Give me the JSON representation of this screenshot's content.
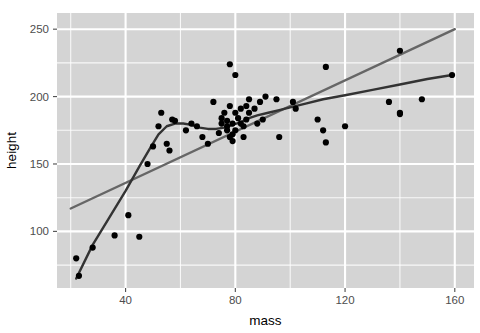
{
  "chart_data": {
    "type": "scatter",
    "title": "",
    "xlabel": "mass",
    "ylabel": "height",
    "xlim": [
      15,
      167
    ],
    "ylim": [
      58,
      262
    ],
    "xticks": [
      40,
      80,
      120,
      160
    ],
    "yticks": [
      100,
      150,
      200,
      250
    ],
    "xtick_labels": [
      "40",
      "80",
      "120",
      "160"
    ],
    "ytick_labels": [
      "100",
      "150",
      "200",
      "250"
    ],
    "grid": true,
    "legend": "none",
    "panel_background": "#d4d4d4",
    "grid_color_major": "#ffffff",
    "grid_color_minor": "#ffffff",
    "point_color": "#000000",
    "point_size": 3.1,
    "points": [
      {
        "x": 22,
        "y": 80
      },
      {
        "x": 23,
        "y": 67
      },
      {
        "x": 28,
        "y": 88
      },
      {
        "x": 36,
        "y": 97
      },
      {
        "x": 41,
        "y": 112
      },
      {
        "x": 45,
        "y": 96
      },
      {
        "x": 48,
        "y": 150
      },
      {
        "x": 50,
        "y": 163
      },
      {
        "x": 52,
        "y": 178
      },
      {
        "x": 53,
        "y": 188
      },
      {
        "x": 55,
        "y": 165
      },
      {
        "x": 56,
        "y": 160
      },
      {
        "x": 57,
        "y": 183
      },
      {
        "x": 58,
        "y": 182
      },
      {
        "x": 62,
        "y": 175
      },
      {
        "x": 64,
        "y": 180
      },
      {
        "x": 66,
        "y": 178
      },
      {
        "x": 68,
        "y": 170
      },
      {
        "x": 70,
        "y": 165
      },
      {
        "x": 72,
        "y": 196
      },
      {
        "x": 74,
        "y": 173
      },
      {
        "x": 75,
        "y": 180
      },
      {
        "x": 75,
        "y": 184
      },
      {
        "x": 76,
        "y": 188
      },
      {
        "x": 77,
        "y": 178
      },
      {
        "x": 77,
        "y": 182
      },
      {
        "x": 77,
        "y": 175
      },
      {
        "x": 78,
        "y": 170
      },
      {
        "x": 78,
        "y": 193
      },
      {
        "x": 78,
        "y": 224
      },
      {
        "x": 79,
        "y": 172
      },
      {
        "x": 79,
        "y": 167
      },
      {
        "x": 79,
        "y": 180
      },
      {
        "x": 80,
        "y": 175
      },
      {
        "x": 80,
        "y": 188
      },
      {
        "x": 80,
        "y": 216
      },
      {
        "x": 81,
        "y": 184
      },
      {
        "x": 82,
        "y": 180
      },
      {
        "x": 82,
        "y": 191
      },
      {
        "x": 83,
        "y": 178
      },
      {
        "x": 83,
        "y": 170
      },
      {
        "x": 84,
        "y": 183
      },
      {
        "x": 84,
        "y": 193
      },
      {
        "x": 85,
        "y": 188
      },
      {
        "x": 85,
        "y": 198
      },
      {
        "x": 87,
        "y": 191
      },
      {
        "x": 88,
        "y": 180
      },
      {
        "x": 89,
        "y": 196
      },
      {
        "x": 90,
        "y": 183
      },
      {
        "x": 91,
        "y": 200
      },
      {
        "x": 95,
        "y": 198
      },
      {
        "x": 96,
        "y": 170
      },
      {
        "x": 101,
        "y": 196
      },
      {
        "x": 102,
        "y": 191
      },
      {
        "x": 110,
        "y": 183
      },
      {
        "x": 112,
        "y": 175
      },
      {
        "x": 113,
        "y": 166
      },
      {
        "x": 113,
        "y": 222
      },
      {
        "x": 120,
        "y": 178
      },
      {
        "x": 136,
        "y": 196
      },
      {
        "x": 140,
        "y": 234
      },
      {
        "x": 140,
        "y": 188
      },
      {
        "x": 140,
        "y": 187
      },
      {
        "x": 148,
        "y": 198
      },
      {
        "x": 159,
        "y": 216
      }
    ],
    "series": [
      {
        "name": "linear-fit",
        "type": "line",
        "color": "#666666",
        "width": 2.4,
        "points": [
          {
            "x": 20,
            "y": 117
          },
          {
            "x": 160,
            "y": 250
          }
        ]
      },
      {
        "name": "loess-fit",
        "type": "line",
        "color": "#333333",
        "width": 2.4,
        "points": [
          {
            "x": 22,
            "y": 65
          },
          {
            "x": 28,
            "y": 90
          },
          {
            "x": 34,
            "y": 110
          },
          {
            "x": 40,
            "y": 130
          },
          {
            "x": 45,
            "y": 148
          },
          {
            "x": 49,
            "y": 162
          },
          {
            "x": 52,
            "y": 172
          },
          {
            "x": 55,
            "y": 178
          },
          {
            "x": 58,
            "y": 180
          },
          {
            "x": 61,
            "y": 180
          },
          {
            "x": 64,
            "y": 179
          },
          {
            "x": 67,
            "y": 177
          },
          {
            "x": 70,
            "y": 176
          },
          {
            "x": 73,
            "y": 176
          },
          {
            "x": 76,
            "y": 177
          },
          {
            "x": 79,
            "y": 179
          },
          {
            "x": 82,
            "y": 181
          },
          {
            "x": 85,
            "y": 184
          },
          {
            "x": 88,
            "y": 186
          },
          {
            "x": 92,
            "y": 188
          },
          {
            "x": 96,
            "y": 190
          },
          {
            "x": 100,
            "y": 192
          },
          {
            "x": 106,
            "y": 195
          },
          {
            "x": 112,
            "y": 198
          },
          {
            "x": 120,
            "y": 201
          },
          {
            "x": 130,
            "y": 205
          },
          {
            "x": 140,
            "y": 209
          },
          {
            "x": 150,
            "y": 213
          },
          {
            "x": 159,
            "y": 216
          }
        ]
      }
    ]
  }
}
